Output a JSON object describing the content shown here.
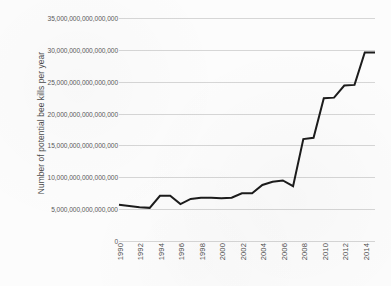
{
  "chart_data": {
    "type": "line",
    "title": "",
    "xlabel": "",
    "ylabel": "Number of potential bee kills per year",
    "x": [
      1990,
      1991,
      1992,
      1993,
      1994,
      1995,
      1996,
      1997,
      1998,
      1999,
      2000,
      2001,
      2002,
      2003,
      2004,
      2005,
      2006,
      2007,
      2008,
      2009,
      2010,
      2011,
      2012,
      2013,
      2014,
      2015
    ],
    "values": [
      5700000000000000,
      5500000000000000,
      5300000000000000,
      5200000000000000,
      7100000000000000,
      7100000000000000,
      5800000000000000,
      6600000000000000,
      6800000000000000,
      6800000000000000,
      6700000000000000,
      6800000000000000,
      7500000000000000,
      7500000000000000,
      8800000000000000,
      9300000000000000,
      9500000000000000,
      8600000000000000,
      16000000000000000,
      16200000000000000,
      22400000000000000,
      22500000000000000,
      24400000000000000,
      24500000000000000,
      29600000000000000,
      29600000000000000
    ],
    "xlim": [
      1990,
      2015
    ],
    "ylim": [
      0,
      35000000000000000
    ],
    "grid": true,
    "legend_position": "none",
    "line_color": "#1c1c1c",
    "x_tick_values": [
      1990,
      1992,
      1994,
      1996,
      1998,
      2000,
      2002,
      2004,
      2006,
      2008,
      2010,
      2012,
      2014
    ],
    "x_tick_labels": [
      "1990",
      "1992",
      "1994",
      "1996",
      "1998",
      "2000",
      "2002",
      "2004",
      "2006",
      "2008",
      "2010",
      "2012",
      "2014"
    ],
    "y_tick_values": [
      0,
      5000000000000000,
      10000000000000000,
      15000000000000000,
      20000000000000000,
      25000000000000000,
      30000000000000000,
      35000000000000000
    ],
    "y_tick_labels": [
      "0",
      "5,000,000,000,000,000",
      "10,000,000,000,000,000",
      "15,000,000,000,000,000",
      "20,000,000,000,000,000",
      "25,000,000,000,000,000",
      "30,000,000,000,000,000",
      "35,000,000,000,000,000"
    ]
  }
}
